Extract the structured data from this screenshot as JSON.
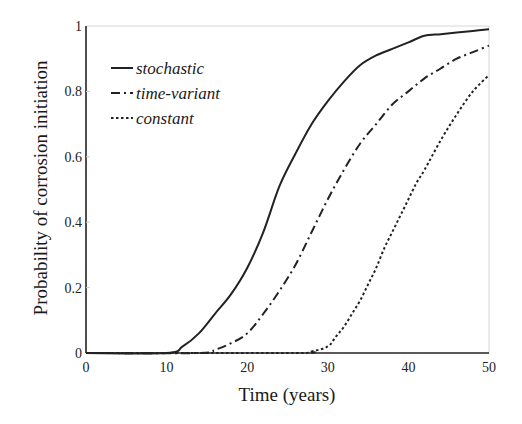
{
  "chart_data": {
    "type": "line",
    "title": "",
    "xlabel": "Time (years)",
    "ylabel": "Probability of corrosion initiation",
    "xlim": [
      0,
      50
    ],
    "ylim": [
      0,
      1
    ],
    "xticks": [
      0,
      10,
      20,
      30,
      40,
      50
    ],
    "yticks": [
      0,
      0.2,
      0.4,
      0.6,
      0.8,
      1
    ],
    "ytick_labels": [
      "0",
      "0.2",
      "0.4",
      "0.6",
      "0.8",
      "1"
    ],
    "grid": false,
    "legend_position": "upper left",
    "series": [
      {
        "name": "stochastic",
        "style": "solid",
        "x": [
          0,
          10,
          12,
          14,
          16,
          18,
          20,
          22,
          24,
          26,
          28,
          30,
          32,
          34,
          36,
          38,
          40,
          42,
          44,
          46,
          48,
          50
        ],
        "values": [
          0,
          0.0,
          0.02,
          0.06,
          0.12,
          0.18,
          0.26,
          0.37,
          0.51,
          0.61,
          0.7,
          0.77,
          0.83,
          0.88,
          0.91,
          0.93,
          0.95,
          0.97,
          0.975,
          0.98,
          0.985,
          0.99
        ]
      },
      {
        "name": "time-variant",
        "style": "dashdot",
        "x": [
          0,
          14,
          16,
          18,
          20,
          22,
          24,
          26,
          28,
          30,
          32,
          34,
          36,
          38,
          40,
          42,
          44,
          46,
          48,
          50
        ],
        "values": [
          0,
          0.0,
          0.01,
          0.03,
          0.06,
          0.12,
          0.19,
          0.27,
          0.37,
          0.47,
          0.56,
          0.64,
          0.7,
          0.76,
          0.8,
          0.84,
          0.87,
          0.9,
          0.92,
          0.94
        ]
      },
      {
        "name": "constant",
        "style": "dotted",
        "x": [
          0,
          26,
          28,
          30,
          31,
          32,
          33,
          34,
          35,
          36,
          37,
          38,
          39,
          40,
          41,
          42,
          44,
          46,
          48,
          50
        ],
        "values": [
          0,
          0.0,
          0.005,
          0.02,
          0.05,
          0.08,
          0.12,
          0.16,
          0.21,
          0.26,
          0.32,
          0.37,
          0.42,
          0.47,
          0.52,
          0.56,
          0.65,
          0.73,
          0.8,
          0.85
        ]
      }
    ]
  },
  "legend": {
    "items": [
      {
        "label": "stochastic"
      },
      {
        "label": "time-variant"
      },
      {
        "label": "constant"
      }
    ]
  },
  "axes": {
    "x_label": "Time (years)",
    "y_label": "Probability of corrosion initiation",
    "x_tick_labels": [
      "0",
      "10",
      "20",
      "30",
      "40",
      "50"
    ],
    "y_tick_labels": [
      "0",
      "0.2",
      "0.4",
      "0.6",
      "0.8",
      "1"
    ]
  }
}
